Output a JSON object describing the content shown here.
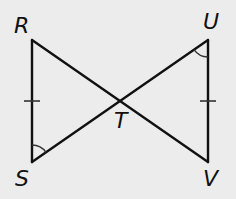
{
  "figure": {
    "background_color": "#ececec",
    "line_color": "#111111",
    "mark_color": "#333333",
    "points": {
      "R": {
        "label": "R",
        "x": 32,
        "y": 40
      },
      "S": {
        "label": "S",
        "x": 32,
        "y": 162
      },
      "U": {
        "label": "U",
        "x": 208,
        "y": 40
      },
      "V": {
        "label": "V",
        "x": 208,
        "y": 162
      },
      "T": {
        "label": "T",
        "x": 120,
        "y": 101
      }
    },
    "segments": [
      "RS",
      "RV",
      "SU",
      "UV"
    ],
    "congruence_marks": {
      "tick_marks": [
        "RS",
        "UV"
      ],
      "angle_arcs": [
        "angle RST (at S)",
        "angle VUT (at U)"
      ]
    },
    "labels": {
      "R": "R",
      "S": "S",
      "T": "T",
      "U": "U",
      "V": "V"
    }
  }
}
